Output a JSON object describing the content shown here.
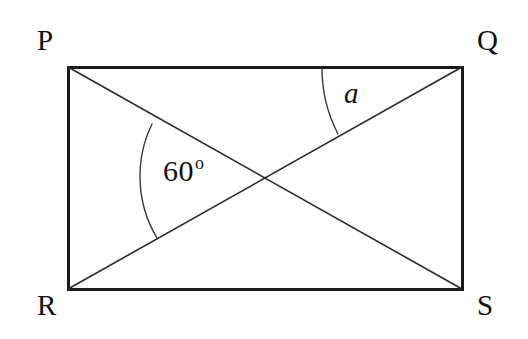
{
  "figure": {
    "name": "rectangle-pqrs-diagonals",
    "background_color": "#ffffff",
    "stroke_color": "#1a1a1a",
    "rectangle_stroke_width": 3,
    "diagonal_stroke_width": 1.6,
    "arc_stroke_width": 1.4
  },
  "vertices": [
    {
      "id": "P",
      "label": "P",
      "corner": "top-left",
      "x": 68,
      "y": 67
    },
    {
      "id": "Q",
      "label": "Q",
      "corner": "top-right",
      "x": 462,
      "y": 67
    },
    {
      "id": "R",
      "label": "R",
      "corner": "bottom-left",
      "x": 68,
      "y": 289
    },
    {
      "id": "S",
      "label": "S",
      "corner": "bottom-right",
      "x": 462,
      "y": 289
    }
  ],
  "rectangle": {
    "left": 68,
    "top": 67,
    "right": 462,
    "bottom": 289,
    "width": 394,
    "height": 222
  },
  "diagonals": [
    {
      "id": "PS",
      "from": "P",
      "to": "S"
    },
    {
      "id": "RQ",
      "from": "R",
      "to": "Q"
    }
  ],
  "intersection": {
    "id": "O",
    "x": 265,
    "y": 178
  },
  "angles": [
    {
      "id": "angle-sixty",
      "label": "60",
      "degree_symbol": "o",
      "value": 60,
      "unit": "degrees",
      "vertex": "O",
      "between": [
        "OP",
        "OR"
      ],
      "arc": {
        "start_x": 152,
        "start_y": 124,
        "end_x": 157,
        "end_y": 238,
        "radius": 120
      },
      "label_x": 163,
      "label_y": 156
    },
    {
      "id": "angle-a",
      "label": "a",
      "value": null,
      "unit": "degrees",
      "vertex": "Q",
      "between": [
        "QP",
        "QR"
      ],
      "arc": {
        "start_x": 322,
        "start_y": 68,
        "end_x": 338,
        "end_y": 134,
        "radius": 142
      },
      "label_x": 344,
      "label_y": 79
    }
  ]
}
